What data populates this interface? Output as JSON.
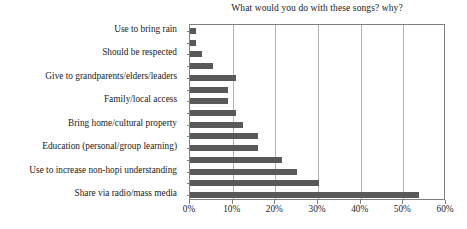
{
  "chart_data": {
    "type": "bar",
    "orientation": "horizontal",
    "title": "What would you do with these songs? why?",
    "xlabel": "",
    "ylabel": "",
    "xlim": [
      0,
      60
    ],
    "xtick_labels": [
      "0%",
      "10%",
      "20%",
      "30%",
      "40%",
      "50%",
      "60%"
    ],
    "xtick_values": [
      0,
      10,
      20,
      30,
      40,
      50,
      60
    ],
    "grid": true,
    "legend": false,
    "bar_color": "#595959",
    "frame_color": "#7f7f7f",
    "gridline_color": "#b3b3b3",
    "categories": [
      "Use to bring rain",
      "",
      "Should be respected",
      "",
      "Give to grandparents/elders/leaders",
      "",
      "Family/local access",
      "",
      "Bring home/cultural property",
      "",
      "Education (personal/group learning)",
      "",
      "Use to increase non-hopi understanding",
      "",
      "Share via radio/mass media"
    ],
    "values": [
      1.3,
      1.3,
      2.7,
      5.5,
      10.7,
      9.0,
      9.0,
      10.7,
      12.5,
      16.0,
      16.0,
      21.5,
      25.0,
      30.3,
      53.6
    ],
    "visible_category_labels": [
      "Use to bring rain",
      "Should be respected",
      "Give to grandparents/elders/leaders",
      "Family/local access",
      "Bring home/cultural property",
      "Education (personal/group learning)",
      "Use to increase non-hopi understanding",
      "Share via radio/mass media"
    ],
    "visible_category_label_indices": [
      0,
      2,
      4,
      6,
      8,
      10,
      12,
      14
    ]
  }
}
